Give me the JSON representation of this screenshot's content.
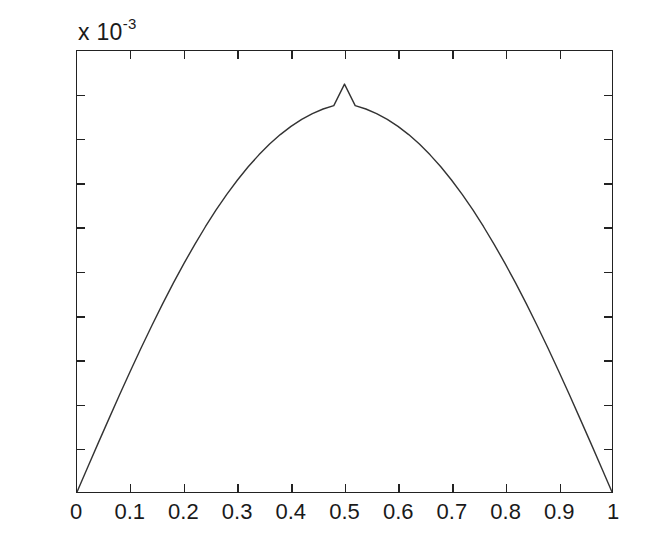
{
  "figure": {
    "exponent_prefix": "x 10",
    "exponent_power": "-3",
    "line_color": "#333333",
    "axis_color": "#222222",
    "background_color": "#ffffff"
  },
  "chart_data": {
    "type": "line",
    "title": "",
    "subtitle": "",
    "xlabel": "",
    "ylabel": "",
    "y_exponent_label": "x 10^-3",
    "y_scale_factor": 0.001,
    "xlim": [
      0,
      1
    ],
    "ylim": [
      0,
      2
    ],
    "grid": false,
    "legend": null,
    "box": true,
    "tick_direction": "in",
    "xticks": [
      0,
      0.1,
      0.2,
      0.3,
      0.4,
      0.5,
      0.6,
      0.7,
      0.8,
      0.9,
      1
    ],
    "xticklabels": [
      "0",
      "0.1",
      "0.2",
      "0.3",
      "0.4",
      "0.5",
      "0.6",
      "0.7",
      "0.8",
      "0.9",
      "1"
    ],
    "yticks": [
      0,
      0.2,
      0.4,
      0.6,
      0.8,
      1,
      1.2,
      1.4,
      1.6,
      1.8,
      2
    ],
    "yticklabels": [
      "0",
      "0.2",
      "0.4",
      "0.6",
      "0.8",
      "1",
      "1.2",
      "1.4",
      "1.6",
      "1.8",
      "2"
    ],
    "peak": {
      "x": 0.5,
      "y": 1.85
    },
    "series": [
      {
        "name": "curve",
        "color": "#333333",
        "linewidth": 1.4,
        "x": [
          0.0,
          0.02,
          0.04,
          0.06,
          0.08,
          0.1,
          0.12,
          0.14,
          0.16,
          0.18,
          0.2,
          0.22,
          0.24,
          0.26,
          0.28,
          0.3,
          0.32,
          0.34,
          0.36,
          0.38,
          0.4,
          0.42,
          0.44,
          0.46,
          0.48,
          0.5,
          0.52,
          0.54,
          0.56,
          0.58,
          0.6,
          0.62,
          0.64,
          0.66,
          0.68,
          0.7,
          0.72,
          0.74,
          0.76,
          0.78,
          0.8,
          0.82,
          0.84,
          0.86,
          0.88,
          0.9,
          0.92,
          0.94,
          0.96,
          0.98,
          1.0
        ],
        "y": [
          0.0,
          0.112,
          0.224,
          0.334,
          0.443,
          0.55,
          0.654,
          0.755,
          0.853,
          0.947,
          1.037,
          1.122,
          1.203,
          1.279,
          1.35,
          1.415,
          1.475,
          1.529,
          1.578,
          1.621,
          1.658,
          1.69,
          1.716,
          1.737,
          1.752,
          1.85,
          1.752,
          1.737,
          1.716,
          1.69,
          1.658,
          1.621,
          1.578,
          1.529,
          1.475,
          1.415,
          1.35,
          1.279,
          1.203,
          1.122,
          1.037,
          0.947,
          0.853,
          0.755,
          0.654,
          0.55,
          0.443,
          0.334,
          0.224,
          0.112,
          0.0
        ]
      }
    ]
  }
}
